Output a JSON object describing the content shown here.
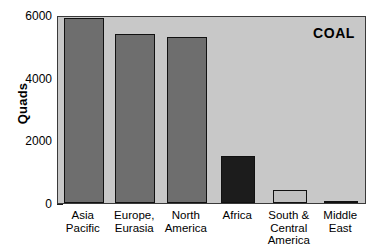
{
  "chart_data": {
    "type": "bar",
    "title": "",
    "annotation": "COAL",
    "xlabel": "",
    "ylabel": "Quads",
    "ylim": [
      0,
      6000
    ],
    "ytick_values": [
      0,
      2000,
      4000,
      6000
    ],
    "ytick_labels": [
      "0",
      "2000",
      "4000",
      "6000"
    ],
    "yminor_values": [
      1000,
      3000,
      5000
    ],
    "grid": false,
    "legend": "none",
    "categories": [
      "Asia\nPacific",
      "Europe,\nEurasia",
      "North\nAmerica",
      "Africa",
      "South &\nCentral\nAmerica",
      "Middle\nEast"
    ],
    "values": [
      5900,
      5400,
      5300,
      1500,
      400,
      80
    ],
    "bar_colors": [
      "#6e6e6e",
      "#6e6e6e",
      "#6e6e6e",
      "#1c1c1c",
      "#c0c0c0",
      "#202020"
    ],
    "plot_background": "#c8c8c8",
    "figure_background": "#ffffff",
    "bar_edge_color": "#111111"
  }
}
